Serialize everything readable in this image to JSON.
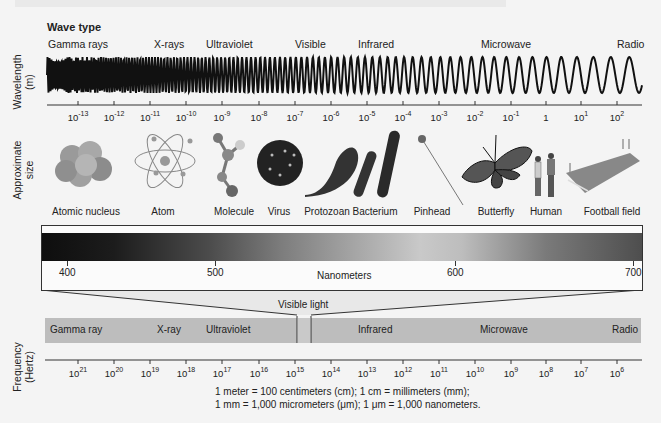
{
  "figure": {
    "section_title": "Wave type",
    "wave_types": [
      {
        "label": "Gamma rays",
        "x": 48
      },
      {
        "label": "X-rays",
        "x": 154
      },
      {
        "label": "Ultraviolet",
        "x": 206
      },
      {
        "label": "Visible",
        "x": 295
      },
      {
        "label": "Infrared",
        "x": 358
      },
      {
        "label": "Microwave",
        "x": 481
      },
      {
        "label": "Radio",
        "x": 617
      }
    ],
    "axis_labels": {
      "wavelength": "Wavelength",
      "wavelength_unit": "(m)",
      "size": "Approximate",
      "size_unit": "size",
      "frequency": "Frequency",
      "frequency_unit": "(Hertz)"
    },
    "wavelength_ticks": [
      {
        "base": "10",
        "exp": "-13",
        "x": 78
      },
      {
        "base": "10",
        "exp": "-12",
        "x": 114
      },
      {
        "base": "10",
        "exp": "-11",
        "x": 150
      },
      {
        "base": "10",
        "exp": "-10",
        "x": 186
      },
      {
        "base": "10",
        "exp": "-9",
        "x": 222
      },
      {
        "base": "10",
        "exp": "-8",
        "x": 259
      },
      {
        "base": "10",
        "exp": "-7",
        "x": 295
      },
      {
        "base": "10",
        "exp": "-6",
        "x": 331
      },
      {
        "base": "10",
        "exp": "-5",
        "x": 367
      },
      {
        "base": "10",
        "exp": "-4",
        "x": 403
      },
      {
        "base": "10",
        "exp": "-3",
        "x": 439
      },
      {
        "base": "10",
        "exp": "-2",
        "x": 475
      },
      {
        "base": "10",
        "exp": "-1",
        "x": 511
      },
      {
        "base": "1",
        "exp": "",
        "x": 546
      },
      {
        "base": "10",
        "exp": "1",
        "x": 581
      },
      {
        "base": "10",
        "exp": "2",
        "x": 617
      }
    ],
    "size_objects": [
      {
        "label": "Atomic nucleus",
        "x": 86,
        "icon": "nucleus"
      },
      {
        "label": "Atom",
        "x": 163,
        "icon": "atom"
      },
      {
        "label": "Molecule",
        "x": 234,
        "icon": "molecule"
      },
      {
        "label": "Virus",
        "x": 279,
        "icon": "virus"
      },
      {
        "label": "Protozoan",
        "x": 327,
        "icon": "protozoan"
      },
      {
        "label": "Bacterium",
        "x": 375,
        "icon": "bacterium"
      },
      {
        "label": "Pinhead",
        "x": 432,
        "icon": "pinhead"
      },
      {
        "label": "Butterfly",
        "x": 496,
        "icon": "butterfly"
      },
      {
        "label": "Human",
        "x": 546,
        "icon": "human"
      },
      {
        "label": "Football field",
        "x": 612,
        "icon": "football-field"
      }
    ],
    "visible_spectrum": {
      "ticks": [
        {
          "label": "400",
          "x": 25
        },
        {
          "label": "500",
          "x": 173
        },
        {
          "label": "600",
          "x": 413
        },
        {
          "label": "700",
          "x": 591
        }
      ],
      "unit_label": "Nanometers",
      "caption": "Visible light"
    },
    "frequency_bands": [
      {
        "label": "Gamma ray",
        "x": 50
      },
      {
        "label": "X-ray",
        "x": 157
      },
      {
        "label": "Ultraviolet",
        "x": 206
      },
      {
        "label": "Infrared",
        "x": 358
      },
      {
        "label": "Microwave",
        "x": 480
      },
      {
        "label": "Radio",
        "x": 612
      }
    ],
    "frequency_ticks": [
      {
        "base": "10",
        "exp": "21",
        "x": 78
      },
      {
        "base": "10",
        "exp": "20",
        "x": 114
      },
      {
        "base": "10",
        "exp": "19",
        "x": 150
      },
      {
        "base": "10",
        "exp": "18",
        "x": 186
      },
      {
        "base": "10",
        "exp": "17",
        "x": 222
      },
      {
        "base": "10",
        "exp": "16",
        "x": 259
      },
      {
        "base": "10",
        "exp": "15",
        "x": 295
      },
      {
        "base": "10",
        "exp": "14",
        "x": 331
      },
      {
        "base": "10",
        "exp": "13",
        "x": 367
      },
      {
        "base": "10",
        "exp": "12",
        "x": 403
      },
      {
        "base": "10",
        "exp": "11",
        "x": 439
      },
      {
        "base": "10",
        "exp": "10",
        "x": 475
      },
      {
        "base": "10",
        "exp": "9",
        "x": 511
      },
      {
        "base": "10",
        "exp": "8",
        "x": 546
      },
      {
        "base": "10",
        "exp": "7",
        "x": 581
      },
      {
        "base": "10",
        "exp": "6",
        "x": 617
      }
    ],
    "footnote": {
      "line1": "1 meter = 100 centimeters (cm); 1 cm = millimeters (mm);",
      "line2": "1 mm = 1,000 micrometers (μm); 1 μm = 1,000 nanometers."
    }
  }
}
